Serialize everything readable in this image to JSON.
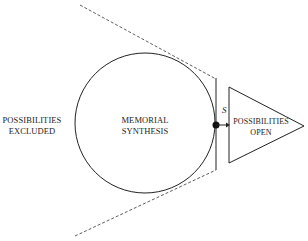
{
  "diagram": {
    "labels": {
      "excluded": [
        "POSSIBILITIES",
        "EXCLUDED"
      ],
      "center": [
        "MEMORIAL",
        "SYNTHESIS"
      ],
      "open": [
        "POSSIBILITIES",
        "OPEN"
      ],
      "point": "S"
    },
    "colors": {
      "stroke": "#222222",
      "background": "#ffffff"
    },
    "shapes": {
      "circle": {
        "cx": 145,
        "cy": 123,
        "r": 70
      },
      "tangent_line": {
        "x": 216,
        "y1": 78,
        "y2": 170
      },
      "dashed_upper": [
        [
          80,
          5
        ],
        [
          216,
          79
        ]
      ],
      "dashed_lower": [
        [
          75,
          236
        ],
        [
          216,
          170
        ]
      ],
      "point": {
        "x": 216,
        "y": 125,
        "r": 3.5
      },
      "arrow": {
        "x1": 216,
        "y1": 125,
        "x2": 229,
        "y2": 125
      },
      "triangle": [
        [
          229,
          87
        ],
        [
          304,
          126
        ],
        [
          229,
          163
        ]
      ]
    }
  }
}
